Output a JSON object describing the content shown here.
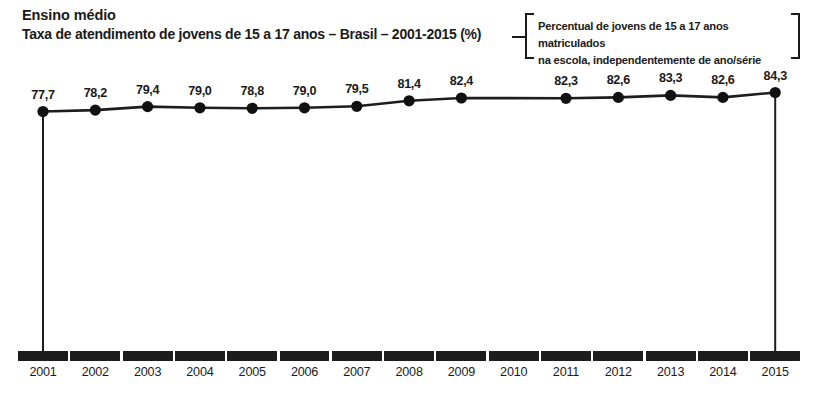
{
  "header": {
    "title": "Ensino médio",
    "subtitle": "Taxa de atendimento de jovens de 15 a 17 anos – Brasil – 2001-2015 (%)"
  },
  "callout": {
    "line1": "Percentual de jovens de 15 a 17 anos matriculados",
    "line2": "na escola, independentemente de ano/série"
  },
  "chart_data": {
    "type": "line",
    "title": "Taxa de atendimento de jovens de 15 a 17 anos – Brasil – 2001-2015 (%)",
    "subtitle": "Ensino médio",
    "annotation": "Percentual de jovens de 15 a 17 anos matriculados na escola, independentemente de ano/série",
    "xlabel": "",
    "ylabel": "",
    "ylim": [
      0,
      100
    ],
    "grid": false,
    "legend": false,
    "categories": [
      "2001",
      "2002",
      "2003",
      "2004",
      "2005",
      "2006",
      "2007",
      "2008",
      "2009",
      "2010",
      "2011",
      "2012",
      "2013",
      "2014",
      "2015"
    ],
    "values": [
      77.7,
      78.2,
      79.4,
      79.0,
      78.8,
      79.0,
      79.5,
      81.4,
      82.4,
      null,
      82.3,
      82.6,
      83.3,
      82.6,
      84.3
    ],
    "value_labels": [
      "77,7",
      "78,2",
      "79,4",
      "79,0",
      "78,8",
      "79,0",
      "79,5",
      "81,4",
      "82,4",
      "",
      "82,3",
      "82,6",
      "83,3",
      "82,6",
      "84,3"
    ],
    "note": "2010 sem dado (Censo Demográfico)",
    "colors": {
      "line": "#1d1d1d",
      "marker": "#111111",
      "axis": "#1d1d1d",
      "text": "#1a1a1a",
      "background": "#ffffff"
    }
  }
}
